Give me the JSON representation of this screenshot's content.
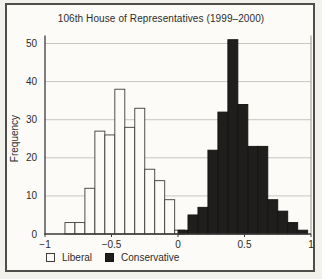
{
  "figure": {
    "frame_color": "#504e4a",
    "background": "#fcfbf8"
  },
  "chart_data": {
    "type": "bar",
    "subtype": "overlaid-histograms",
    "title": "106th House of Representatives (1999–2000)",
    "xlabel": "",
    "ylabel": "Frequency",
    "xlim": [
      -1,
      1
    ],
    "ylim": [
      0,
      50
    ],
    "grid": "horizontal",
    "legend_position": "bottom-left",
    "bin_width": 0.075,
    "x_ticks": [
      {
        "value": -1,
        "label": "−1"
      },
      {
        "value": -0.5,
        "label": "−0.5"
      },
      {
        "value": 0,
        "label": "0"
      },
      {
        "value": 0.5,
        "label": "0.5"
      },
      {
        "value": 1,
        "label": "1"
      }
    ],
    "y_ticks": [
      {
        "value": 0,
        "label": "0"
      },
      {
        "value": 10,
        "label": "10"
      },
      {
        "value": 20,
        "label": "20"
      },
      {
        "value": 30,
        "label": "30"
      },
      {
        "value": 40,
        "label": "40"
      },
      {
        "value": 50,
        "label": "50"
      }
    ],
    "series": [
      {
        "name": "Liberal",
        "fill": "#fcfbf8",
        "stroke": "#3c3c3c",
        "bin_start": -0.85,
        "values": [
          3,
          3,
          12,
          27,
          26,
          38,
          28,
          33,
          17,
          14,
          9,
          1
        ]
      },
      {
        "name": "Conservative",
        "fill": "#1f1e1d",
        "stroke": "#121212",
        "bin_start": 0.0,
        "values": [
          1,
          5,
          7,
          22,
          32,
          51,
          34,
          23,
          23,
          9,
          6,
          3,
          1
        ]
      }
    ]
  },
  "legend": {
    "items": [
      {
        "label": "Liberal",
        "swatch_fill": "#fcfbf8",
        "swatch_stroke": "#3c3c3c"
      },
      {
        "label": "Conservative",
        "swatch_fill": "#1f1e1d",
        "swatch_stroke": "#121212"
      }
    ]
  }
}
